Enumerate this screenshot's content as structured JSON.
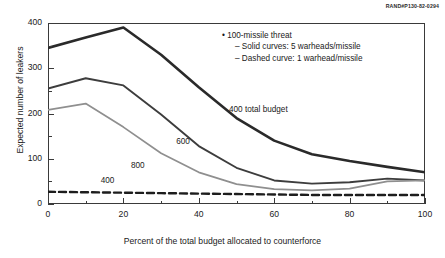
{
  "publication_id": "RAND#P130-82-0294",
  "axes": {
    "ylabel": "Expected number of leakers",
    "xlabel": "Percent of the total budget allocated to counterforce",
    "yticks": [
      "0",
      "100",
      "200",
      "300",
      "400"
    ],
    "xticks": [
      "0",
      "20",
      "40",
      "60",
      "80",
      "100"
    ]
  },
  "legend": {
    "bullet": "•",
    "dash": "–",
    "line1": "100-missile threat",
    "line2": "Solid curves: 5 warheads/missile",
    "line3": "Dashed curve: 1 warhead/missile"
  },
  "curve_labels": {
    "budget400": "400 total budget",
    "budget600": "600",
    "budget800": "800",
    "dashed400": "400"
  },
  "colors": {
    "solid_400": "#2a2a2a",
    "solid_600": "#3d3d3d",
    "solid_800": "#8f8f8f",
    "dashed": "#1d1d1d",
    "frame": "#3a3a3a"
  },
  "chart_data": {
    "type": "line",
    "title": "",
    "xlabel": "Percent of the total budget allocated to counterforce",
    "ylabel": "Expected number of leakers",
    "xlim": [
      0,
      100
    ],
    "ylim": [
      0,
      400
    ],
    "grid": false,
    "legend_position": "upper-right-inside",
    "x_major_step": 20,
    "x_minor_step": 10,
    "y_major_step": 100,
    "y_minor_step": 50,
    "annotations": [
      {
        "text": "400 total budget",
        "x": 48,
        "y": 205
      },
      {
        "text": "600",
        "x": 34,
        "y": 135
      },
      {
        "text": "800",
        "x": 22,
        "y": 82
      },
      {
        "text": "400",
        "x": 14,
        "y": 48
      }
    ],
    "series": [
      {
        "name": "400 total budget",
        "style": "solid",
        "width": 2.6,
        "color": "#2a2a2a",
        "x": [
          0,
          10,
          20,
          30,
          40,
          50,
          60,
          70,
          80,
          90,
          100
        ],
        "values": [
          345,
          368,
          390,
          330,
          258,
          190,
          140,
          110,
          95,
          82,
          70
        ]
      },
      {
        "name": "600",
        "style": "solid",
        "width": 1.9,
        "color": "#3d3d3d",
        "x": [
          0,
          10,
          20,
          30,
          40,
          50,
          60,
          70,
          80,
          90,
          100
        ],
        "values": [
          255,
          278,
          262,
          198,
          128,
          80,
          52,
          45,
          48,
          56,
          52
        ]
      },
      {
        "name": "800",
        "style": "solid",
        "width": 1.7,
        "color": "#8f8f8f",
        "x": [
          0,
          10,
          20,
          30,
          40,
          50,
          60,
          70,
          80,
          90,
          100
        ],
        "values": [
          208,
          222,
          170,
          112,
          70,
          44,
          33,
          30,
          34,
          50,
          52
        ]
      },
      {
        "name": "400 (1 warhead/missile)",
        "style": "dashed",
        "width": 2.4,
        "color": "#1d1d1d",
        "x": [
          0,
          10,
          20,
          30,
          40,
          50,
          60,
          70,
          80,
          90,
          100
        ],
        "values": [
          27,
          26,
          25,
          24,
          23,
          22,
          21,
          20,
          20,
          20,
          20
        ]
      }
    ]
  }
}
